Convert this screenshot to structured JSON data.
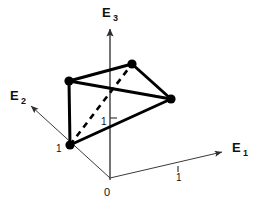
{
  "figure": {
    "background_color": "#ffffff",
    "stroke_color": "#111111",
    "axis_color": "#3a3a3a",
    "edge_color": "#000000",
    "width": 258,
    "height": 206
  },
  "axes": [
    {
      "id": "e1",
      "label_base": "E",
      "label_sub": "1",
      "label_x": 232,
      "label_y": 152,
      "sub_x": 243,
      "sub_y": 156,
      "from": {
        "x": 110,
        "y": 178
      },
      "to": {
        "x": 222,
        "y": 152
      },
      "stroke_width": 1.0,
      "arrow": true
    },
    {
      "id": "e2",
      "label_base": "E",
      "label_sub": "2",
      "label_x": 10,
      "label_y": 100,
      "sub_x": 21,
      "sub_y": 104,
      "from": {
        "x": 110,
        "y": 178
      },
      "to": {
        "x": 31,
        "y": 106
      },
      "stroke_width": 1.0,
      "arrow": true
    },
    {
      "id": "e3",
      "label_base": "E",
      "label_sub": "3",
      "label_x": 102,
      "label_y": 17,
      "sub_x": 113,
      "sub_y": 21,
      "from": {
        "x": 110,
        "y": 180
      },
      "to": {
        "x": 110,
        "y": 29
      },
      "stroke_width": 1.4,
      "arrow": true
    }
  ],
  "ticks": [
    {
      "id": "tick-e1-one",
      "label": "1",
      "x": 176,
      "y": 181,
      "mark_x": 178,
      "mark_y1": 166,
      "mark_y2": 172
    },
    {
      "id": "tick-e3-one",
      "label": "1",
      "x": 101,
      "y": 125,
      "mark_x1": 110,
      "mark_x2": 117,
      "mark_y": 118
    },
    {
      "id": "tick-e2-one",
      "label": "1",
      "x": 56,
      "y": 152,
      "mark_x": null,
      "mark_y": null
    }
  ],
  "vertices": [
    {
      "id": "vertex-left-lower",
      "x": 70,
      "y": 145,
      "r": 4.6
    },
    {
      "id": "vertex-left-upper",
      "x": 69,
      "y": 81,
      "r": 4.6
    },
    {
      "id": "vertex-top",
      "x": 132,
      "y": 64,
      "r": 4.6
    },
    {
      "id": "vertex-right",
      "x": 171,
      "y": 99,
      "r": 4.6
    }
  ],
  "solid_edges": [
    {
      "id": "edge-leftupper-top",
      "x1": 69,
      "y1": 81,
      "x2": 132,
      "y2": 64,
      "width": 3.0
    },
    {
      "id": "edge-top-right",
      "x1": 132,
      "y1": 64,
      "x2": 171,
      "y2": 99,
      "width": 3.0
    },
    {
      "id": "edge-leftupper-right",
      "x1": 69,
      "y1": 81,
      "x2": 171,
      "y2": 99,
      "width": 3.0
    },
    {
      "id": "edge-leftlower-right",
      "x1": 70,
      "y1": 145,
      "x2": 171,
      "y2": 99,
      "width": 3.0
    },
    {
      "id": "edge-leftupper-leftlower",
      "x1": 69,
      "y1": 81,
      "x2": 70,
      "y2": 145,
      "width": 3.0
    }
  ],
  "dashed_edges": [
    {
      "id": "edge-hidden-leftlower-top",
      "x1": 70,
      "y1": 145,
      "x2": 132,
      "y2": 64,
      "width": 2.6,
      "dash": "6 5"
    }
  ],
  "origin": {
    "id": "origin-label",
    "label": "0",
    "x": 104,
    "y": 196,
    "point_x": 110,
    "point_y": 178
  }
}
